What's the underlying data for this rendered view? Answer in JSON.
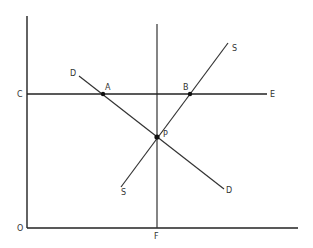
{
  "diagram": {
    "type": "supply-demand",
    "colors": {
      "line": "#333333",
      "background": "#ffffff"
    },
    "labels": {
      "origin": "O",
      "price_level": "C",
      "horizontal_line_end": "E",
      "vertical_line_foot": "F",
      "demand_top": "D",
      "demand_bottom": "D",
      "supply_top": "S",
      "supply_bottom": "S",
      "point_a": "A",
      "point_b": "B",
      "point_p": "P"
    },
    "points": {
      "A": {
        "desc": "intersection of demand curve D and line CE"
      },
      "B": {
        "desc": "intersection of supply curve S and line CE"
      },
      "P": {
        "desc": "equilibrium: intersection of D and S on vertical line F"
      }
    }
  }
}
